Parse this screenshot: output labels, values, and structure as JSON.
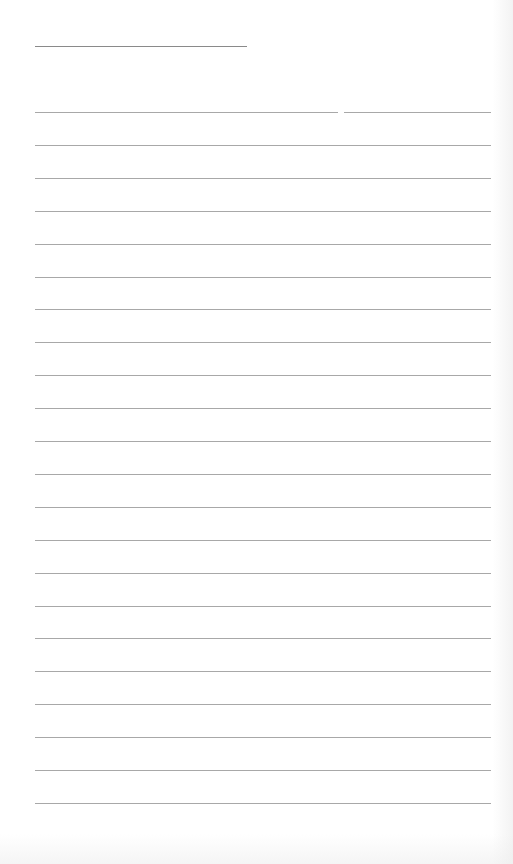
{
  "document": {
    "type": "blank lined writing sheet",
    "title_field": {
      "value": "",
      "line_x": [
        35,
        247
      ],
      "line_y": 46
    },
    "lines": {
      "count": 22,
      "first_y": 112,
      "spacing": 32.9,
      "x_range": [
        35,
        491
      ],
      "first_line_split_at_x": [
        338,
        344
      ]
    },
    "colors": {
      "paper": "#ffffff",
      "rule": "#a8a8a8",
      "title_rule": "#8a8a8a"
    }
  }
}
